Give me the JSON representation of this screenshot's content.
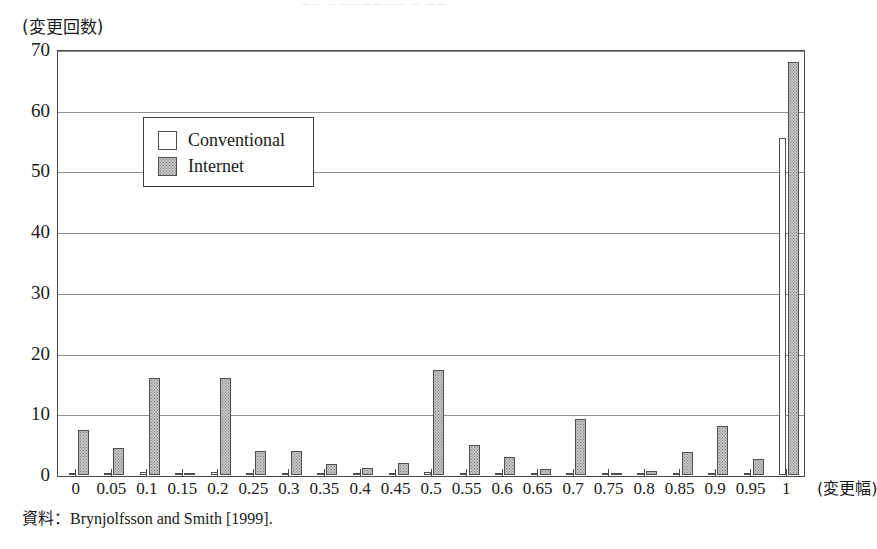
{
  "figure": {
    "top_cropped_text": "－－ －－－－－－－ － －－",
    "y_axis_title": "(変更回数)",
    "x_axis_unit": "(変更幅)",
    "source_note_prefix": "資料：",
    "source_note_text": "Brynjolfsson and Smith [1999]."
  },
  "legend": {
    "items": [
      {
        "label": "Conventional",
        "swatch": "white",
        "color": "#ffffff"
      },
      {
        "label": "Internet",
        "swatch": "dotted-gray",
        "color": "#c6c6c6"
      }
    ]
  },
  "chart_data": {
    "type": "bar",
    "title": "",
    "subtitle": "",
    "xlabel": "(変更幅)",
    "ylabel": "(変更回数)",
    "ylim": [
      0,
      70
    ],
    "yticks": [
      0,
      10,
      20,
      30,
      40,
      50,
      60,
      70
    ],
    "grid": true,
    "legend_position": "upper-left-inside",
    "categories": [
      "0",
      "0.05",
      "0.1",
      "0.15",
      "0.2",
      "0.25",
      "0.3",
      "0.35",
      "0.4",
      "0.45",
      "0.5",
      "0.55",
      "0.6",
      "0.65",
      "0.7",
      "0.75",
      "0.8",
      "0.85",
      "0.9",
      "0.95",
      "1"
    ],
    "series": [
      {
        "name": "Conventional",
        "color": "#ffffff",
        "values": [
          0.4,
          0.4,
          0.5,
          0.4,
          0.5,
          0.4,
          0.4,
          0.4,
          0.4,
          0.4,
          0.5,
          0.4,
          0.4,
          0.4,
          0.4,
          0.4,
          0.4,
          0.4,
          0.4,
          0.4,
          55.5
        ]
      },
      {
        "name": "Internet",
        "color": "#c6c6c6",
        "values": [
          7.5,
          4.5,
          16.0,
          0.3,
          16.0,
          3.9,
          3.9,
          1.9,
          1.1,
          2.0,
          17.3,
          5.0,
          3.0,
          1.0,
          9.2,
          0.2,
          0.7,
          3.8,
          8.0,
          2.6,
          68.0
        ]
      }
    ]
  }
}
